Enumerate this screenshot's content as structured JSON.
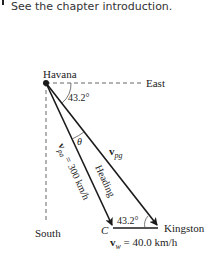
{
  "intro": {
    "text": "See the chapter introduction."
  },
  "diagram": {
    "labels": {
      "havana": "Havana",
      "east": "East",
      "south": "South",
      "kingston": "Kingston",
      "c_point": "C",
      "angle_top": "43.2°",
      "angle_bottom": "43.2°",
      "theta": "θ",
      "heading": "Heading",
      "v_pa_sym": "v",
      "v_pa_sub": "pa",
      "v_pa_value": " = 300 km/h",
      "v_pg_sym": "v",
      "v_pg_sub": "pg",
      "v_w_sym": "v",
      "v_w_sub": "w",
      "v_w_value": " = 40.0 km/h"
    },
    "values": {
      "angle_deg": 43.2,
      "v_pa_kmh": 300,
      "v_w_kmh": 40.0
    },
    "colors": {
      "line": "#1a1a1a",
      "dashed": "#555555",
      "text": "#222222"
    }
  }
}
